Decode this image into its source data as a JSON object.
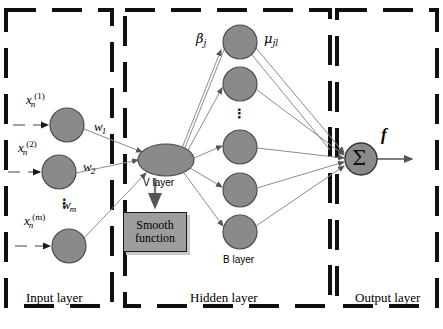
{
  "figure": {
    "background": "#ffffff",
    "node_fill": "#8a8a8a",
    "node_stroke": "#4d4d4d",
    "edge_color": "#8c8c8c",
    "box_border": "#111111"
  },
  "groups": [
    {
      "id": "input",
      "label": "Input layer",
      "x": 6,
      "y": 10,
      "w": 106,
      "h": 296
    },
    {
      "id": "hidden",
      "label": "Hidden layer",
      "x": 125,
      "y": 10,
      "w": 205,
      "h": 296
    },
    {
      "id": "output",
      "label": "Output layer",
      "x": 337,
      "y": 10,
      "w": 100,
      "h": 296
    }
  ],
  "input_layer": {
    "label": "Input layer",
    "nodes": [
      {
        "id": "x1",
        "base": "x",
        "sub": "n",
        "sup": "(1)",
        "cx": 67,
        "cy": 125,
        "r": 17
      },
      {
        "id": "x2",
        "base": "x",
        "sub": "n",
        "sup": "(2)",
        "cx": 59,
        "cy": 172,
        "r": 17
      },
      {
        "id": "xm",
        "base": "x",
        "sub": "n",
        "sup": "(m)",
        "cx": 69,
        "cy": 246,
        "r": 17
      }
    ],
    "ellipsis": "⋮",
    "weights": [
      {
        "id": "w1",
        "base": "w",
        "sub": "1",
        "x": 94,
        "y": 126
      },
      {
        "id": "w2",
        "base": "w",
        "sub": "2",
        "x": 83,
        "y": 164
      },
      {
        "id": "wm",
        "base": "w",
        "sub": "m",
        "x": 62,
        "y": 205
      }
    ]
  },
  "hidden_layer": {
    "label": "Hidden layer",
    "v_node": {
      "id": "v",
      "label": "V layer",
      "cx": 166,
      "cy": 160,
      "rx": 28,
      "ry": 16
    },
    "b_label": "B layer",
    "b_nodes": [
      {
        "id": "b1",
        "cx": 240,
        "cy": 42,
        "r": 17
      },
      {
        "id": "b2",
        "cx": 240,
        "cy": 84,
        "r": 17
      },
      {
        "id": "b3",
        "cx": 240,
        "cy": 147,
        "r": 17
      },
      {
        "id": "b4",
        "cx": 240,
        "cy": 190,
        "r": 17
      },
      {
        "id": "b5",
        "cx": 240,
        "cy": 232,
        "r": 17
      }
    ],
    "ellipsis": "⋮",
    "edge_labels": [
      {
        "id": "beta",
        "glyph": "β",
        "sub": "j",
        "x": 196,
        "y": 38
      },
      {
        "id": "mu",
        "glyph": "μ",
        "sub": "jl",
        "x": 265,
        "y": 38
      }
    ]
  },
  "output_layer": {
    "label": "Output layer",
    "node": {
      "id": "sigma",
      "glyph": "Σ",
      "cx": 361,
      "cy": 159,
      "r": 16
    },
    "output_label": "f"
  },
  "smooth_block": {
    "line1": "Smooth",
    "line2": "function"
  }
}
